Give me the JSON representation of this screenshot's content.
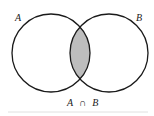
{
  "diagram": {
    "type": "venn",
    "sets": [
      {
        "label": "A",
        "cx": 51,
        "cy": 53,
        "r": 39
      },
      {
        "label": "B",
        "cx": 109,
        "cy": 53,
        "r": 39
      }
    ],
    "highlighted_region": "intersection",
    "caption": {
      "set_a": "A",
      "operator": "∩",
      "set_b": "B"
    },
    "colors": {
      "stroke": "#1a1a1a",
      "fill_intersection": "#bdbdbd",
      "baseline": "#e0e0e0"
    }
  }
}
